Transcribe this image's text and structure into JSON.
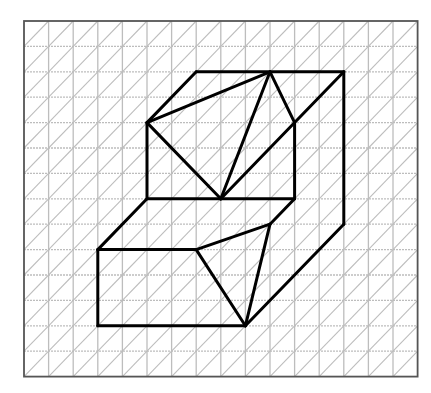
{
  "diagram": {
    "type": "isometric-grid-figure",
    "grid": {
      "columns": 16,
      "rows": 14,
      "origin_px": [
        24,
        21
      ],
      "cell_width_px": 24.6,
      "cell_height_px": 25.4,
      "diagonal_direction": "bottom-left-to-top-right",
      "grid_color": "#bdbdbd",
      "border_color": "#555555"
    },
    "figure": {
      "stroke_color": "#000000",
      "stroke_width": 3,
      "vertices": {
        "A": [
          7,
          2
        ],
        "B": [
          10,
          2
        ],
        "C": [
          13,
          2
        ],
        "D": [
          5,
          4
        ],
        "E": [
          11,
          4
        ],
        "F": [
          5,
          7
        ],
        "G": [
          8,
          7
        ],
        "H": [
          11,
          7
        ],
        "I": [
          10,
          8
        ],
        "J": [
          13,
          8
        ],
        "K": [
          3,
          9
        ],
        "L": [
          7,
          9
        ],
        "M": [
          3,
          12
        ],
        "N": [
          9,
          12
        ]
      },
      "edges": [
        [
          "A",
          "C"
        ],
        [
          "A",
          "D"
        ],
        [
          "D",
          "B"
        ],
        [
          "B",
          "G"
        ],
        [
          "B",
          "E"
        ],
        [
          "C",
          "G"
        ],
        [
          "D",
          "G"
        ],
        [
          "D",
          "F"
        ],
        [
          "E",
          "H"
        ],
        [
          "F",
          "H"
        ],
        [
          "C",
          "J"
        ],
        [
          "J",
          "N"
        ],
        [
          "H",
          "I"
        ],
        [
          "F",
          "K"
        ],
        [
          "K",
          "L"
        ],
        [
          "L",
          "I"
        ],
        [
          "K",
          "M"
        ],
        [
          "M",
          "N"
        ],
        [
          "L",
          "N"
        ],
        [
          "I",
          "N"
        ]
      ]
    }
  }
}
